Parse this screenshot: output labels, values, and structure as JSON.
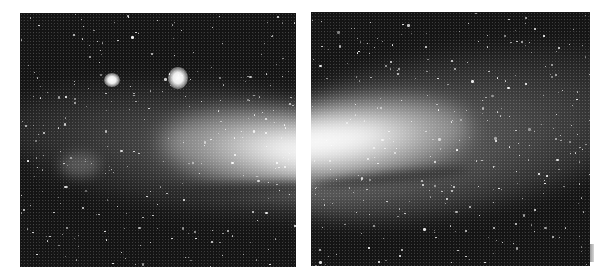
{
  "image": {
    "subject": "Andromeda Galaxy (M31) photographed in two panels",
    "style": "monochrome astrophotograph",
    "background_color": "#ffffff",
    "sky_color": "#141414",
    "core_color": "#ffffff"
  },
  "panels": [
    {
      "id": "left",
      "features": [
        "galaxy-core-left-half",
        "companion-galaxy-m110",
        "companion-galaxy-m32",
        "dust-lane",
        "star-field"
      ]
    },
    {
      "id": "right",
      "features": [
        "galaxy-core-right-half",
        "spiral-arm",
        "dust-lane",
        "star-field"
      ]
    }
  ]
}
